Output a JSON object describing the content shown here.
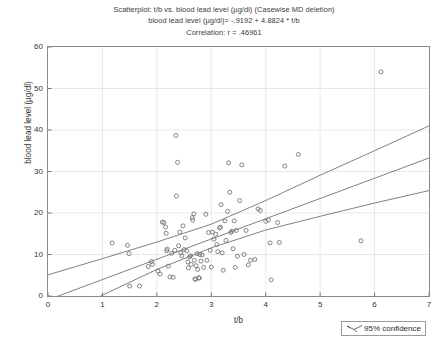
{
  "title": {
    "line1": "Scatterplot: t/b vs. blood lead level (µg/dl) (Casewise MD deletion)",
    "line2": "blood lead level (µg/dl)= -.9192 + 4.8824 * t/b",
    "line3": "Correlation: r = .46961"
  },
  "legend": {
    "label": "95% confidence",
    "icon": "confidence-band-icon"
  },
  "chart_data": {
    "type": "scatter",
    "title": "Scatterplot: t/b vs. blood lead level (µg/dl) (Casewise MD deletion)",
    "subtitle": "blood lead level (µg/dl)= -.9192 + 4.8824 * t/b",
    "annotation": "Correlation: r = .46961",
    "xlabel": "t/b",
    "ylabel": "blood lead level (µg/dl)",
    "xlim": [
      0,
      7
    ],
    "ylim": [
      0,
      60
    ],
    "xticks": [
      0,
      1,
      2,
      3,
      4,
      5,
      6,
      7
    ],
    "yticks": [
      0,
      10,
      20,
      30,
      40,
      50,
      60
    ],
    "grid": true,
    "legend_position": "below-right",
    "marker": "open-circle",
    "marker_color": "#6f6f6f",
    "line_color": "#6a6a6a",
    "regression": {
      "intercept": -0.9192,
      "slope": 4.8824,
      "r": 0.46961,
      "label": "blood lead level (µg/dl)= -.9192 + 4.8824 * t/b"
    },
    "confidence": {
      "level": 0.95,
      "label": "95% confidence",
      "upper": [
        [
          0,
          5.1
        ],
        [
          1,
          9.0
        ],
        [
          2,
          13.0
        ],
        [
          3,
          17.3
        ],
        [
          4,
          23.0
        ],
        [
          5,
          29.1
        ],
        [
          6,
          35.0
        ],
        [
          7,
          41.0
        ]
      ],
      "lower": [
        [
          0,
          -6.9
        ],
        [
          1,
          0.2
        ],
        [
          2,
          6.4
        ],
        [
          3,
          11.6
        ],
        [
          4,
          15.9
        ],
        [
          5,
          19.2
        ],
        [
          6,
          22.4
        ],
        [
          7,
          25.4
        ]
      ]
    },
    "points": [
      [
        1.18,
        12.8
      ],
      [
        1.46,
        12.2
      ],
      [
        1.49,
        10.2
      ],
      [
        1.5,
        2.4
      ],
      [
        1.68,
        2.4
      ],
      [
        1.84,
        7.1
      ],
      [
        1.9,
        8.3
      ],
      [
        1.92,
        7.6
      ],
      [
        2.02,
        6.0
      ],
      [
        2.06,
        5.3
      ],
      [
        2.1,
        17.8
      ],
      [
        2.13,
        17.7
      ],
      [
        2.16,
        16.6
      ],
      [
        2.17,
        15.1
      ],
      [
        2.18,
        10.9
      ],
      [
        2.19,
        11.3
      ],
      [
        2.21,
        7.2
      ],
      [
        2.24,
        4.6
      ],
      [
        2.27,
        10.3
      ],
      [
        2.3,
        4.5
      ],
      [
        2.33,
        11.0
      ],
      [
        2.35,
        38.7
      ],
      [
        2.36,
        24.1
      ],
      [
        2.38,
        32.2
      ],
      [
        2.4,
        12.1
      ],
      [
        2.42,
        15.4
      ],
      [
        2.44,
        10.4
      ],
      [
        2.46,
        9.7
      ],
      [
        2.48,
        16.9
      ],
      [
        2.5,
        11.2
      ],
      [
        2.52,
        14.0
      ],
      [
        2.55,
        10.9
      ],
      [
        2.57,
        8.2
      ],
      [
        2.58,
        6.8
      ],
      [
        2.6,
        9.4
      ],
      [
        2.62,
        9.7
      ],
      [
        2.63,
        7.6
      ],
      [
        2.65,
        18.9
      ],
      [
        2.66,
        18.3
      ],
      [
        2.68,
        19.8
      ],
      [
        2.69,
        8.6
      ],
      [
        2.7,
        4.1
      ],
      [
        2.71,
        4.0
      ],
      [
        2.72,
        7.3
      ],
      [
        2.74,
        10.2
      ],
      [
        2.75,
        6.4
      ],
      [
        2.77,
        4.4
      ],
      [
        2.78,
        4.3
      ],
      [
        2.79,
        10.0
      ],
      [
        2.81,
        8.4
      ],
      [
        2.83,
        9.9
      ],
      [
        2.86,
        6.9
      ],
      [
        2.9,
        19.7
      ],
      [
        2.92,
        8.6
      ],
      [
        2.95,
        15.3
      ],
      [
        2.98,
        11.0
      ],
      [
        3.0,
        7.0
      ],
      [
        3.02,
        15.4
      ],
      [
        3.05,
        13.7
      ],
      [
        3.08,
        14.9
      ],
      [
        3.1,
        12.4
      ],
      [
        3.12,
        10.7
      ],
      [
        3.15,
        16.4
      ],
      [
        3.17,
        16.6
      ],
      [
        3.18,
        22.0
      ],
      [
        3.2,
        10.4
      ],
      [
        3.22,
        6.2
      ],
      [
        3.25,
        18.1
      ],
      [
        3.27,
        13.4
      ],
      [
        3.3,
        20.4
      ],
      [
        3.32,
        32.1
      ],
      [
        3.34,
        25.0
      ],
      [
        3.36,
        15.3
      ],
      [
        3.38,
        15.6
      ],
      [
        3.4,
        11.4
      ],
      [
        3.42,
        18.1
      ],
      [
        3.44,
        6.9
      ],
      [
        3.46,
        15.8
      ],
      [
        3.48,
        9.6
      ],
      [
        3.52,
        23.0
      ],
      [
        3.56,
        31.6
      ],
      [
        3.6,
        10.0
      ],
      [
        3.64,
        15.8
      ],
      [
        3.68,
        7.5
      ],
      [
        3.72,
        8.6
      ],
      [
        3.8,
        8.8
      ],
      [
        3.86,
        21.0
      ],
      [
        3.9,
        20.6
      ],
      [
        4.0,
        18.0
      ],
      [
        4.05,
        18.3
      ],
      [
        4.08,
        12.8
      ],
      [
        4.1,
        3.9
      ],
      [
        4.22,
        17.7
      ],
      [
        4.25,
        12.9
      ],
      [
        4.35,
        31.3
      ],
      [
        4.6,
        34.1
      ],
      [
        5.75,
        13.3
      ],
      [
        6.12,
        54.0
      ]
    ]
  }
}
